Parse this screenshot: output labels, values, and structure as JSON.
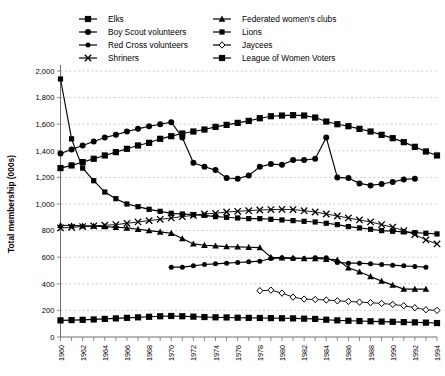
{
  "chart_data": {
    "type": "line",
    "title": "",
    "xlabel": "",
    "ylabel": "Total membership (000s)",
    "xlim": [
      1960,
      1994
    ],
    "ylim": [
      0,
      2000
    ],
    "ytick_step": 200,
    "grid": true,
    "legend_position": "top",
    "ytick_labels": [
      "0",
      "200",
      "400",
      "600",
      "800",
      "1,000",
      "1,200",
      "1,400",
      "1,600",
      "1,800",
      "2,000"
    ],
    "xtick_labels": [
      "1960",
      "1962",
      "1964",
      "1966",
      "1968",
      "1970",
      "1972",
      "1974",
      "1976",
      "1978",
      "1980",
      "1982",
      "1984",
      "1986",
      "1988",
      "1990",
      "1992",
      "1994"
    ],
    "x": [
      1960,
      1961,
      1962,
      1963,
      1964,
      1965,
      1966,
      1967,
      1968,
      1969,
      1970,
      1971,
      1972,
      1973,
      1974,
      1975,
      1976,
      1977,
      1978,
      1979,
      1980,
      1981,
      1982,
      1983,
      1984,
      1985,
      1986,
      1987,
      1988,
      1989,
      1990,
      1991,
      1992,
      1993,
      1994
    ],
    "series": [
      {
        "name": "Elks",
        "marker": "square",
        "values": [
          1270,
          1290,
          1315,
          1340,
          1365,
          1390,
          1415,
          1440,
          1460,
          1490,
          1510,
          1530,
          1545,
          1560,
          1580,
          1595,
          1610,
          1625,
          1645,
          1660,
          1665,
          1668,
          1665,
          1650,
          1620,
          1600,
          1585,
          1565,
          1545,
          1520,
          1495,
          1465,
          1430,
          1395,
          1365
        ]
      },
      {
        "name": "Boy Scout volunteers",
        "marker": "circle",
        "values": [
          1380,
          1410,
          1440,
          1470,
          1500,
          1520,
          1545,
          1565,
          1585,
          1600,
          1615,
          1500,
          1310,
          1280,
          1255,
          1195,
          1190,
          1215,
          1280,
          1300,
          1295,
          1330,
          1330,
          1340,
          1500,
          1200,
          1195,
          1155,
          1140,
          1150,
          1165,
          1185,
          1190,
          null,
          null
        ]
      },
      {
        "name": "Red Cross volunteers",
        "marker": "circle-sm",
        "values": [
          null,
          null,
          null,
          null,
          null,
          null,
          null,
          null,
          null,
          null,
          525,
          525,
          535,
          545,
          550,
          555,
          560,
          565,
          570,
          590,
          595,
          590,
          590,
          595,
          595,
          560,
          555,
          555,
          550,
          545,
          540,
          535,
          530,
          525,
          null
        ]
      },
      {
        "name": "Shriners",
        "marker": "cross",
        "values": [
          820,
          825,
          830,
          835,
          840,
          845,
          855,
          865,
          875,
          885,
          895,
          905,
          915,
          925,
          930,
          940,
          945,
          950,
          955,
          958,
          960,
          958,
          950,
          940,
          925,
          910,
          895,
          880,
          865,
          845,
          825,
          800,
          770,
          730,
          700
        ]
      },
      {
        "name": "Federated women's clubs",
        "marker": "triangle",
        "values": [
          840,
          838,
          836,
          834,
          830,
          825,
          820,
          810,
          800,
          790,
          780,
          740,
          700,
          690,
          685,
          680,
          678,
          675,
          672,
          600,
          595,
          595,
          590,
          590,
          585,
          580,
          520,
          490,
          455,
          420,
          390,
          360,
          360,
          360,
          null
        ]
      },
      {
        "name": "Lions",
        "marker": "square-sm",
        "values": [
          1940,
          1490,
          1270,
          1175,
          1090,
          1040,
          1000,
          980,
          960,
          945,
          930,
          925,
          920,
          915,
          905,
          900,
          895,
          890,
          890,
          885,
          880,
          875,
          870,
          865,
          855,
          845,
          830,
          820,
          810,
          800,
          795,
          790,
          785,
          780,
          775
        ]
      },
      {
        "name": "Jaycees",
        "marker": "diamond",
        "values": [
          null,
          null,
          null,
          null,
          null,
          null,
          null,
          null,
          null,
          null,
          null,
          null,
          null,
          null,
          null,
          null,
          null,
          null,
          348,
          352,
          330,
          300,
          285,
          282,
          278,
          272,
          268,
          262,
          258,
          252,
          245,
          235,
          220,
          205,
          200
        ]
      },
      {
        "name": "League of Women Voters",
        "marker": "square",
        "values": [
          125,
          127,
          129,
          132,
          136,
          140,
          144,
          148,
          152,
          156,
          158,
          156,
          153,
          150,
          148,
          147,
          145,
          144,
          143,
          142,
          141,
          140,
          138,
          136,
          130,
          125,
          122,
          120,
          118,
          116,
          114,
          112,
          110,
          108,
          105
        ]
      }
    ]
  },
  "legend": {
    "items": [
      {
        "label": "Elks",
        "marker": "square"
      },
      {
        "label": "Boy Scout volunteers",
        "marker": "circle"
      },
      {
        "label": "Red Cross volunteers",
        "marker": "circle-sm"
      },
      {
        "label": "Shriners",
        "marker": "cross"
      },
      {
        "label": "Federated women's clubs",
        "marker": "triangle"
      },
      {
        "label": "Lions",
        "marker": "square-sm"
      },
      {
        "label": "Jaycees",
        "marker": "diamond"
      },
      {
        "label": "League of Women Voters",
        "marker": "square"
      }
    ]
  },
  "colors": {
    "line": "#000000",
    "grid": "#b9b9b9",
    "axis": "#6e6e6e",
    "background": "#ffffff"
  }
}
